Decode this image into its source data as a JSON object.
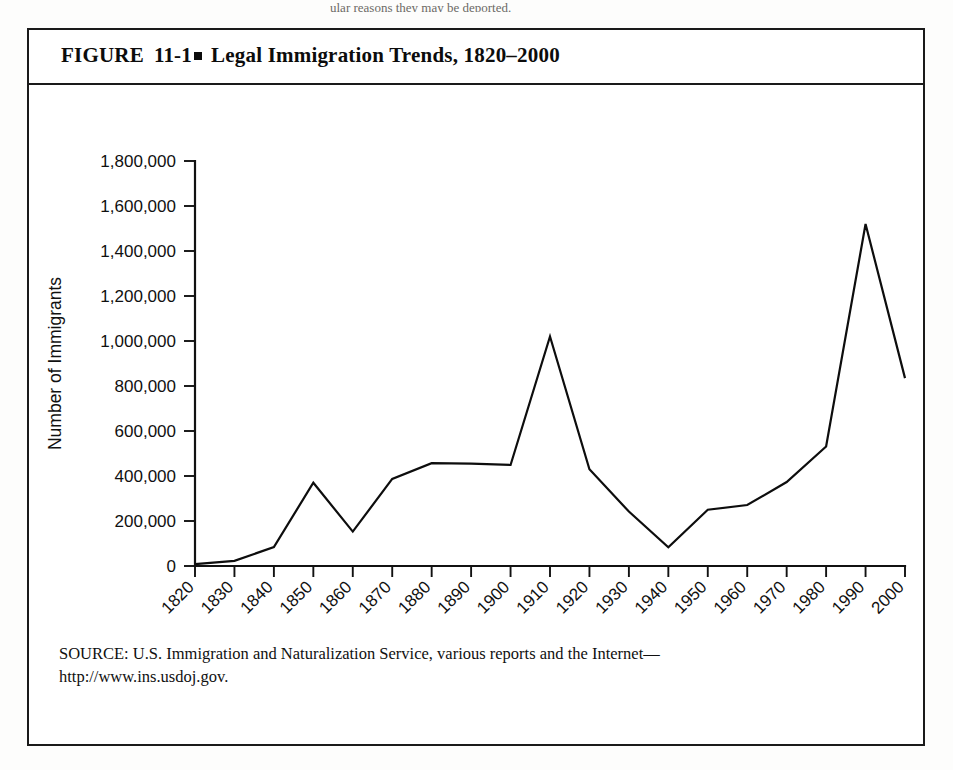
{
  "page": {
    "top_partial_text": "ular reasons they may be deported."
  },
  "figure": {
    "label": "FIGURE",
    "number": "11-1",
    "bullet": "square-bullet",
    "title": "Legal Immigration Trends, 1820–2000",
    "source_line_1": "SOURCE: U.S. Immigration and Naturalization Service, various reports and the Internet—",
    "source_line_2": "http://www.ins.usdoj.gov."
  },
  "chart_data": {
    "type": "line",
    "title": "Legal Immigration Trends, 1820–2000",
    "xlabel": "Year",
    "ylabel": "Number of Immigrants",
    "grid": false,
    "legend": "none",
    "xlim": [
      1820,
      2000
    ],
    "ylim": [
      0,
      1800000
    ],
    "ytick_step": 200000,
    "ytick_labels": [
      "0",
      "200,000",
      "400,000",
      "600,000",
      "800,000",
      "1,000,000",
      "1,200,000",
      "1,400,000",
      "1,600,000",
      "1,800,000"
    ],
    "ytick_values": [
      0,
      200000,
      400000,
      600000,
      800000,
      1000000,
      1200000,
      1400000,
      1600000,
      1800000
    ],
    "categories": [
      "1820",
      "1830",
      "1840",
      "1850",
      "1860",
      "1870",
      "1880",
      "1890",
      "1900",
      "1910",
      "1920",
      "1930",
      "1940",
      "1950",
      "1960",
      "1970",
      "1980",
      "1990",
      "2000"
    ],
    "x": [
      1820,
      1830,
      1840,
      1850,
      1860,
      1870,
      1880,
      1890,
      1900,
      1910,
      1920,
      1930,
      1940,
      1950,
      1960,
      1970,
      1980,
      1990,
      2000
    ],
    "values": [
      8000,
      23000,
      84000,
      370000,
      153000,
      387000,
      457000,
      455000,
      449000,
      1020000,
      430000,
      242000,
      83000,
      250000,
      271000,
      373000,
      531000,
      1520000,
      835000
    ],
    "series_name": "Number of Immigrants"
  }
}
